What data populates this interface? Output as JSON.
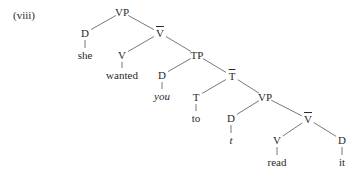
{
  "example_label": "(viii)",
  "tree": {
    "nodes": [
      {
        "id": "vp1",
        "label": "VP",
        "x": 122,
        "y": 12
      },
      {
        "id": "d1",
        "label": "D",
        "x": 85,
        "y": 33
      },
      {
        "id": "she",
        "label": "she",
        "x": 85,
        "y": 55,
        "leaf": true
      },
      {
        "id": "vbar1",
        "label": "V",
        "bar": true,
        "x": 160,
        "y": 33
      },
      {
        "id": "v1",
        "label": "V",
        "x": 122,
        "y": 55
      },
      {
        "id": "wanted",
        "label": "wanted",
        "x": 122,
        "y": 75,
        "leaf": true
      },
      {
        "id": "tp",
        "label": "TP",
        "x": 197,
        "y": 55
      },
      {
        "id": "d2",
        "label": "D",
        "x": 162,
        "y": 75
      },
      {
        "id": "you",
        "label": "you",
        "x": 162,
        "y": 96,
        "leaf": true,
        "italic": true
      },
      {
        "id": "tbar",
        "label": "T",
        "bar": true,
        "x": 232,
        "y": 76
      },
      {
        "id": "t",
        "label": "T",
        "x": 196,
        "y": 97
      },
      {
        "id": "to",
        "label": "to",
        "x": 196,
        "y": 118,
        "leaf": true
      },
      {
        "id": "vp2",
        "label": "VP",
        "x": 265,
        "y": 97
      },
      {
        "id": "d3",
        "label": "D",
        "x": 231,
        "y": 118
      },
      {
        "id": "trace",
        "label": "t",
        "x": 231,
        "y": 140,
        "leaf": true,
        "italic": true
      },
      {
        "id": "vbar2",
        "label": "V",
        "bar": true,
        "x": 308,
        "y": 119
      },
      {
        "id": "v2",
        "label": "V",
        "x": 277,
        "y": 140
      },
      {
        "id": "read",
        "label": "read",
        "x": 277,
        "y": 162,
        "leaf": true
      },
      {
        "id": "d4",
        "label": "D",
        "x": 342,
        "y": 140
      },
      {
        "id": "it",
        "label": "it",
        "x": 342,
        "y": 162,
        "leaf": true
      }
    ],
    "edges": [
      [
        "vp1",
        "d1"
      ],
      [
        "vp1",
        "vbar1"
      ],
      [
        "d1",
        "she"
      ],
      [
        "vbar1",
        "v1"
      ],
      [
        "vbar1",
        "tp"
      ],
      [
        "v1",
        "wanted"
      ],
      [
        "tp",
        "d2"
      ],
      [
        "tp",
        "tbar"
      ],
      [
        "d2",
        "you"
      ],
      [
        "tbar",
        "t"
      ],
      [
        "tbar",
        "vp2"
      ],
      [
        "t",
        "to"
      ],
      [
        "vp2",
        "d3"
      ],
      [
        "vp2",
        "vbar2"
      ],
      [
        "d3",
        "trace"
      ],
      [
        "vbar2",
        "v2"
      ],
      [
        "vbar2",
        "d4"
      ],
      [
        "v2",
        "read"
      ],
      [
        "d4",
        "it"
      ]
    ]
  },
  "colors": {
    "line": "#555555",
    "text": "#2a2a2a"
  }
}
